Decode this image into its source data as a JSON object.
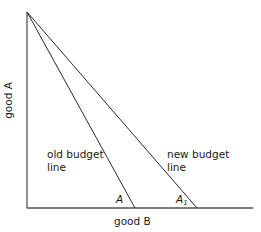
{
  "diagram": {
    "type": "budget-line",
    "axes": {
      "x_label": "good B",
      "y_label": "good A"
    },
    "lines": [
      {
        "id": "old",
        "label_line1": "old budget",
        "label_line2": "line",
        "intercept_label": "A"
      },
      {
        "id": "new",
        "label_line1": "new budget",
        "label_line2": "line",
        "intercept_label": "A",
        "intercept_subscript": "1"
      }
    ],
    "colors": {
      "line": "#2a2a2a",
      "axis": "#555555",
      "text": "#1a1a1a",
      "background": "#ffffff"
    }
  }
}
